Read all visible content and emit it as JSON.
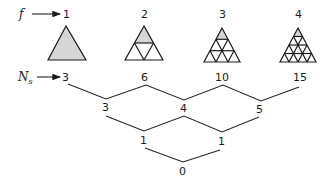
{
  "labels": {
    "f": "f",
    "Ns_main": "N",
    "Ns_sub": "s"
  },
  "colors": {
    "ink": "#1a1a1a",
    "shade": "#d6d6d6",
    "background": "#ffffff"
  },
  "frequencies": [
    {
      "f": "1",
      "subdivisions": 1
    },
    {
      "f": "2",
      "subdivisions": 2
    },
    {
      "f": "3",
      "subdivisions": 3
    },
    {
      "f": "4",
      "subdivisions": 4
    }
  ],
  "difference_table": {
    "row0_Ns": [
      "3",
      "6",
      "10",
      "15"
    ],
    "row1": [
      "3",
      "4",
      "5"
    ],
    "row2": [
      "1",
      "1"
    ],
    "row3": [
      "0"
    ]
  }
}
